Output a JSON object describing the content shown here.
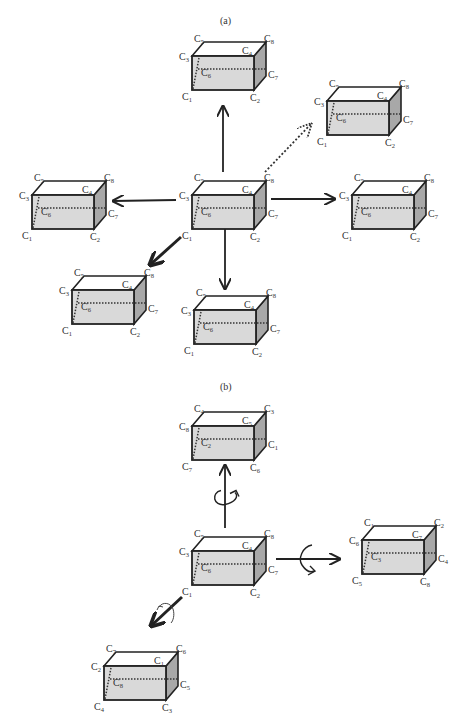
{
  "panels": {
    "a": {
      "label": "(a)"
    },
    "b": {
      "label": "(b)"
    }
  },
  "colors": {
    "front_face": "#d9d9d9",
    "side_face": "#a8a8a8",
    "edge": "#222222",
    "label": "#333333"
  },
  "boxes": [
    {
      "id": "a-top",
      "x": 192,
      "y": 38,
      "labels": {
        "tl": "C5",
        "tr": "C8",
        "ml": "C3",
        "mr": "C4",
        "r": "C7",
        "in": "C6",
        "bl": "C1",
        "br": "C2"
      }
    },
    {
      "id": "a-upright",
      "x": 327,
      "y": 83,
      "labels": {
        "tl": "C5",
        "tr": "C8",
        "ml": "C3",
        "mr": "C4",
        "r": "C7",
        "in": "C6",
        "bl": "C1",
        "br": "C2"
      }
    },
    {
      "id": "a-left",
      "x": 32,
      "y": 177,
      "labels": {
        "tl": "C5",
        "tr": "C8",
        "ml": "C3",
        "mr": "C4",
        "r": "C7",
        "in": "C6",
        "bl": "C1",
        "br": "C2"
      }
    },
    {
      "id": "a-center",
      "x": 192,
      "y": 177,
      "labels": {
        "tl": "C5",
        "tr": "C8",
        "ml": "C3",
        "mr": "C4",
        "r": "C7",
        "in": "C6",
        "bl": "C1",
        "br": "C2"
      }
    },
    {
      "id": "a-right",
      "x": 352,
      "y": 177,
      "labels": {
        "tl": "C5",
        "tr": "C8",
        "ml": "C3",
        "mr": "C4",
        "r": "C7",
        "in": "C6",
        "bl": "C1",
        "br": "C2"
      }
    },
    {
      "id": "a-downleft",
      "x": 72,
      "y": 272,
      "labels": {
        "tl": "C5",
        "tr": "C8",
        "ml": "C3",
        "mr": "C4",
        "r": "C7",
        "in": "C6",
        "bl": "C1",
        "br": "C2"
      }
    },
    {
      "id": "a-down",
      "x": 194,
      "y": 292,
      "labels": {
        "tl": "C5",
        "tr": "C8",
        "ml": "C3",
        "mr": "C4",
        "r": "C7",
        "in": "C6",
        "bl": "C1",
        "br": "C2"
      }
    },
    {
      "id": "b-top",
      "x": 192,
      "y": 408,
      "labels": {
        "tl": "C4",
        "tr": "C3",
        "ml": "C8",
        "mr": "C5",
        "r": "C1",
        "in": "C2",
        "bl": "C7",
        "br": "C6"
      }
    },
    {
      "id": "b-center",
      "x": 192,
      "y": 533,
      "labels": {
        "tl": "C5",
        "tr": "C8",
        "ml": "C3",
        "mr": "C4",
        "r": "C7",
        "in": "C6",
        "bl": "C1",
        "br": "C2"
      }
    },
    {
      "id": "b-right",
      "x": 362,
      "y": 522,
      "labels": {
        "tl": "C1",
        "tr": "C2",
        "ml": "C6",
        "mr": "C7",
        "r": "C4",
        "in": "C3",
        "bl": "C5",
        "br": "C8"
      }
    },
    {
      "id": "b-bottomleft",
      "x": 104,
      "y": 648,
      "labels": {
        "tl": "C7",
        "tr": "C6",
        "ml": "C2",
        "mr": "C1",
        "r": "C5",
        "in": "C8",
        "bl": "C4",
        "br": "C3"
      }
    }
  ],
  "arrows": [
    {
      "id": "a-up",
      "style": "solid",
      "from": [
        223,
        172
      ],
      "to": [
        223,
        106
      ]
    },
    {
      "id": "a-upright",
      "style": "dotted",
      "from": [
        265,
        172
      ],
      "to": [
        311,
        124
      ]
    },
    {
      "id": "a-left",
      "style": "solid",
      "from": [
        176,
        200
      ],
      "to": [
        113,
        201
      ]
    },
    {
      "id": "a-right",
      "style": "solid",
      "from": [
        271,
        199
      ],
      "to": [
        335,
        199
      ]
    },
    {
      "id": "a-downleft",
      "style": "bold",
      "from": [
        181,
        237
      ],
      "to": [
        151,
        264
      ]
    },
    {
      "id": "a-down",
      "style": "solid",
      "from": [
        225,
        227
      ],
      "to": [
        225,
        289
      ]
    },
    {
      "id": "b-up",
      "style": "rotate",
      "from": [
        225,
        528
      ],
      "to": [
        225,
        465
      ]
    },
    {
      "id": "b-right",
      "style": "rotate",
      "from": [
        276,
        559
      ],
      "to": [
        340,
        559
      ]
    },
    {
      "id": "b-downleft",
      "style": "rotate",
      "from": [
        182,
        597
      ],
      "to": [
        152,
        625
      ]
    }
  ]
}
